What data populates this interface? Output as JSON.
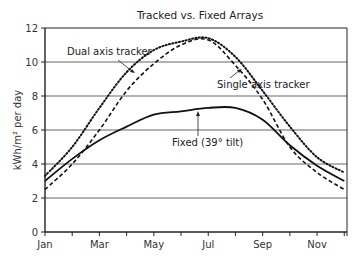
{
  "chart_data": {
    "type": "line",
    "title": "Tracked vs. Fixed Arrays",
    "xlabel": "",
    "ylabel": "kWh/m² per day",
    "ylim": [
      0,
      12
    ],
    "yticks": [
      0,
      2,
      4,
      6,
      8,
      10,
      12
    ],
    "grid": true,
    "x": [
      "Jan",
      "Feb",
      "Mar",
      "Apr",
      "May",
      "Jun",
      "Jul",
      "Aug",
      "Sep",
      "Oct",
      "Nov",
      "Dec"
    ],
    "xtick_labels": [
      "Jan",
      "Mar",
      "May",
      "Jul",
      "Sep",
      "Nov"
    ],
    "legend_position": "inline annotations",
    "series": [
      {
        "name": "Dual axis tracker",
        "style": "dotted",
        "values": [
          3.3,
          5.0,
          7.3,
          9.4,
          10.7,
          11.2,
          11.4,
          10.3,
          8.3,
          6.2,
          4.4,
          3.5
        ]
      },
      {
        "name": "Single axis tracker",
        "style": "dashed",
        "values": [
          2.5,
          4.0,
          6.0,
          8.3,
          9.9,
          11.0,
          11.3,
          9.8,
          7.8,
          5.0,
          3.5,
          2.5
        ]
      },
      {
        "name": "Fixed (39° tilt)",
        "style": "solid",
        "values": [
          3.0,
          4.3,
          5.4,
          6.2,
          6.9,
          7.1,
          7.3,
          7.3,
          6.6,
          5.1,
          3.9,
          3.0
        ]
      }
    ],
    "annotations": [
      {
        "text": "Dual axis tracker",
        "target": "Dual axis tracker"
      },
      {
        "text": "Single axis tracker",
        "target": "Single axis tracker"
      },
      {
        "text": "Fixed (39° tilt)",
        "target": "Fixed (39° tilt)"
      }
    ]
  }
}
